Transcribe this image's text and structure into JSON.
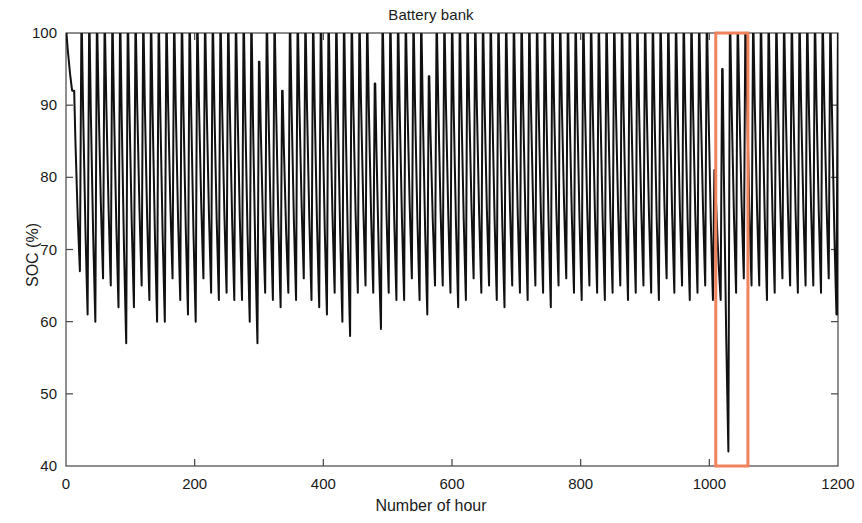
{
  "figure": {
    "title": "Battery bank",
    "background": "#ffffff",
    "width": 862,
    "height": 523
  },
  "axes": {
    "xlabel": "Number of hour",
    "ylabel": "SOC (%)",
    "x_ticks": [
      "0",
      "200",
      "400",
      "600",
      "800",
      "1000",
      "1200"
    ],
    "y_ticks": [
      "40",
      "50",
      "60",
      "70",
      "80",
      "90",
      "100"
    ]
  },
  "annotation": {
    "highlight_box_label": "deep-discharge-highlight",
    "color": "#F0825C",
    "x_start": 1010,
    "x_end": 1060,
    "y_start": 40,
    "y_end": 100
  },
  "chart_data": {
    "type": "line",
    "title": "Battery bank",
    "xlabel": "Number of hour",
    "ylabel": "SOC (%)",
    "xlim": [
      0,
      1200
    ],
    "ylim": [
      40,
      100
    ],
    "x_ticks": [
      0,
      200,
      400,
      600,
      800,
      1000,
      1200
    ],
    "y_ticks": [
      40,
      50,
      60,
      70,
      80,
      90,
      100
    ],
    "grid": false,
    "legend": null,
    "line_color": "#111111",
    "line_width": 2.0,
    "series": [
      {
        "name": "State of charge",
        "description": "Daily battery state-of-charge cycling: charge to near 100% each day, then discharge overnight to a daily minimum. One highlighted event near hour 1010-1060 shows a partial charge followed by deep discharge to ~42%.",
        "cycle_peaks": [
          100,
          92,
          100,
          100,
          100,
          100,
          100,
          100,
          100,
          100,
          100,
          100,
          100,
          100,
          100,
          100,
          100,
          100,
          100,
          100,
          100,
          100,
          100,
          100,
          100,
          96,
          100,
          100,
          92,
          100,
          100,
          100,
          100,
          100,
          100,
          100,
          100,
          100,
          100,
          100,
          93,
          100,
          100,
          100,
          100,
          100,
          100,
          94,
          100,
          100,
          100,
          100,
          100,
          100,
          100,
          100,
          100,
          100,
          100,
          100,
          100,
          100,
          100,
          100,
          100,
          100,
          100,
          100,
          100,
          100,
          100,
          100,
          100,
          100,
          100,
          100,
          100,
          100,
          100,
          100,
          100,
          100,
          100,
          100,
          81,
          95,
          100,
          100,
          100,
          100,
          100,
          100,
          100,
          100,
          100,
          100,
          100,
          100,
          100,
          100
        ],
        "cycle_minima": [
          92,
          67,
          61,
          60,
          66,
          65,
          62,
          57,
          62,
          65,
          63,
          60,
          60,
          66,
          63,
          61,
          60,
          66,
          64,
          63,
          64,
          63,
          63,
          60,
          57,
          64,
          63,
          62,
          64,
          63,
          66,
          63,
          62,
          61,
          64,
          60,
          58,
          64,
          65,
          64,
          59,
          64,
          63,
          63,
          66,
          63,
          61,
          65,
          65,
          64,
          62,
          63,
          66,
          64,
          65,
          63,
          62,
          65,
          64,
          63,
          65,
          64,
          62,
          65,
          66,
          64,
          63,
          65,
          64,
          63,
          64,
          65,
          63,
          64,
          65,
          64,
          63,
          66,
          64,
          65,
          63,
          64,
          65,
          63,
          63,
          42,
          64,
          66,
          65,
          65,
          63,
          64,
          66,
          65,
          64,
          65,
          65,
          64,
          66,
          61
        ],
        "overall_min": 42,
        "overall_max": 100,
        "cycle_period_hours": 12
      }
    ],
    "annotations": [
      {
        "type": "rectangle",
        "color": "#F0825C",
        "x_range": [
          1010,
          1060
        ],
        "y_range": [
          40,
          100
        ],
        "note": "Highlights a partial-charge / deep-discharge event reaching ~42% SOC"
      }
    ]
  }
}
